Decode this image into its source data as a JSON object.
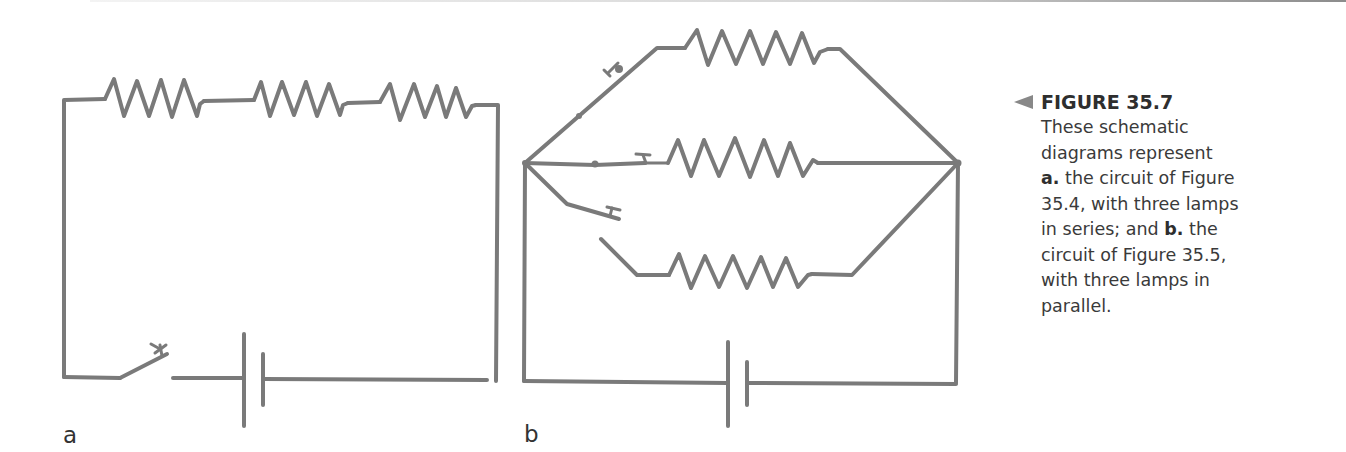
{
  "figure": {
    "number_label": "FIGURE 35.7",
    "caption": {
      "line1": "These schematic",
      "line2": "diagrams represent",
      "part_a_marker": "a.",
      "line3_rest": " the circuit of Figure",
      "line4": "35.4, with three lamps",
      "line5_start": "in series; and ",
      "part_b_marker": "b.",
      "line5_rest": " the",
      "line6": "circuit of Figure 35.5,",
      "line7": "with three lamps in",
      "line8": "parallel."
    }
  },
  "panels": [
    {
      "label": "a",
      "circuit_type": "series",
      "components": {
        "lamps_as_resistors": 3,
        "switches": 1,
        "battery_cells": 1
      }
    },
    {
      "label": "b",
      "circuit_type": "parallel",
      "components": {
        "lamps_as_resistors": 3,
        "switches": 3,
        "battery_cells": 1
      }
    }
  ],
  "colors": {
    "wire": "#7a7a7a",
    "caption_arrow": "#888888",
    "text": "#3a3a3a"
  }
}
